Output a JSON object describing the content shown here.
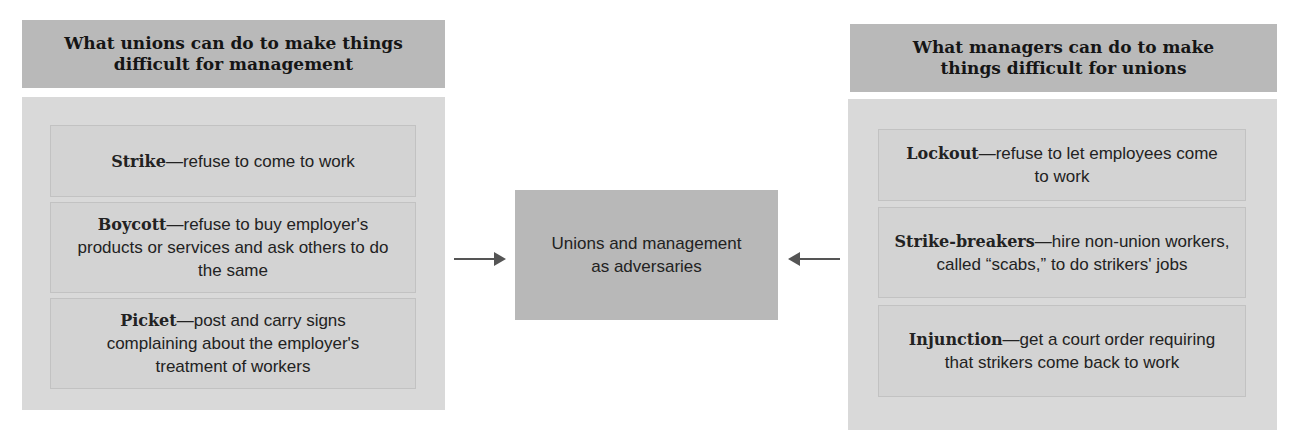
{
  "left": {
    "title": "What unions can do to make things difficult for management",
    "items": [
      {
        "term": "Strike",
        "desc": "—refuse to come to work"
      },
      {
        "term": "Boycott",
        "desc": "—refuse to buy employer's products or services and ask others to do the same"
      },
      {
        "term": "Picket",
        "desc": "—post and carry signs complaining about the employer's treatment of workers"
      }
    ]
  },
  "center": {
    "label": "Unions and management as adversaries"
  },
  "right": {
    "title": "What managers can do to make things difficult for unions",
    "items": [
      {
        "term": "Lockout",
        "desc": "—refuse to let employees come to work"
      },
      {
        "term": "Strike-breakers",
        "desc": "—hire non-union workers, called “scabs,” to do strikers' jobs"
      },
      {
        "term": "Injunction",
        "desc": "—get a court order requiring that strikers come back to work"
      }
    ]
  },
  "arrows": {
    "left_icon": "arrow-right-icon",
    "right_icon": "arrow-left-icon",
    "color": "#555555"
  }
}
